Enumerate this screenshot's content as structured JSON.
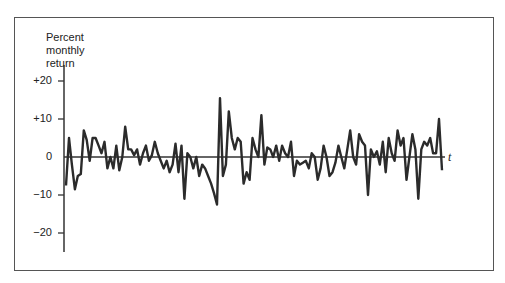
{
  "chart_data": {
    "type": "line",
    "title": "",
    "ylabel": "Percent monthly return",
    "xlabel": "t",
    "ylim": [
      -25,
      24
    ],
    "yticks": [
      20,
      10,
      0,
      -10,
      -20
    ],
    "ytick_labels": [
      "+20",
      "+10",
      "0",
      "−10",
      "−20"
    ],
    "grid": false,
    "legend": null,
    "series": [
      {
        "name": "monthly return",
        "values": [
          -7.5,
          5,
          -2,
          -8.5,
          -5,
          -4.5,
          7,
          4.5,
          -1,
          5,
          5,
          3,
          1,
          4,
          -3,
          0,
          -3,
          3,
          -3.5,
          0,
          8,
          2,
          2,
          0.5,
          2,
          -2,
          1,
          3,
          -1,
          0.5,
          4,
          1,
          -1,
          -3,
          -1,
          -4,
          -2,
          3.5,
          -4,
          3,
          -11,
          1,
          0,
          -3,
          0,
          -5,
          -2,
          -3,
          -5,
          -7,
          -9.5,
          -12.5,
          15.5,
          -5,
          -2,
          12,
          5,
          2,
          5,
          4,
          -7,
          -4,
          -6,
          5,
          2,
          0,
          11,
          -2,
          2.5,
          2,
          0,
          3,
          -1,
          3,
          1,
          0,
          4,
          -5,
          -1,
          -2,
          -1.5,
          -1,
          -3,
          1,
          0,
          -6,
          -3,
          3,
          0,
          -5,
          -4,
          -1.5,
          3,
          0,
          -3,
          2,
          7,
          0,
          -2,
          6,
          4,
          3,
          -10,
          2,
          0,
          1.5,
          -2,
          4,
          -4,
          5,
          1,
          -1,
          7,
          3,
          5,
          -6,
          0,
          6,
          2,
          -11,
          2,
          4,
          3,
          5,
          1,
          1,
          10,
          -3.5
        ]
      }
    ]
  },
  "labels": {
    "ylabel_line1": "Percent",
    "ylabel_line2": "monthly",
    "ylabel_line3": "return",
    "tick_p20": "+20",
    "tick_p10": "+10",
    "tick_0": "0",
    "tick_m10": "−10",
    "tick_m20": "−20",
    "x_axis": "t"
  },
  "colors": {
    "line": "#2b2b2b",
    "axis": "#333333",
    "frame": "#555555"
  }
}
